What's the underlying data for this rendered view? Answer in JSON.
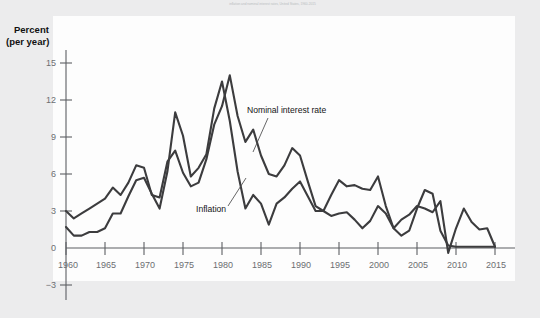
{
  "figure": {
    "header_note": "inflation and nominal interest rates, United States, 1960-2015",
    "axis_title_line1": "Percent",
    "axis_title_line2": "(per year)"
  },
  "annotations": {
    "nominal_label": "Nominal interest rate",
    "inflation_label": "Inflation"
  },
  "chart_data": {
    "type": "line",
    "title": "",
    "xlabel": "",
    "ylabel": "Percent (per year)",
    "xlim": [
      1960,
      2015
    ],
    "ylim": [
      -3,
      15
    ],
    "xticks": [
      1960,
      1965,
      1970,
      1975,
      1980,
      1985,
      1990,
      1995,
      2000,
      2005,
      2010,
      2015
    ],
    "yticks": [
      -3,
      0,
      3,
      6,
      9,
      12,
      15
    ],
    "ytick_labels": [
      "−3",
      "0",
      "3",
      "6",
      "9",
      "12",
      "15"
    ],
    "grid": false,
    "legend_position": "inline-annotation",
    "x": [
      1960,
      1961,
      1962,
      1963,
      1964,
      1965,
      1966,
      1967,
      1968,
      1969,
      1970,
      1971,
      1972,
      1973,
      1974,
      1975,
      1976,
      1977,
      1978,
      1979,
      1980,
      1981,
      1982,
      1983,
      1984,
      1985,
      1986,
      1987,
      1988,
      1989,
      1990,
      1991,
      1992,
      1993,
      1994,
      1995,
      1996,
      1997,
      1998,
      1999,
      2000,
      2001,
      2002,
      2003,
      2004,
      2005,
      2006,
      2007,
      2008,
      2009,
      2010,
      2011,
      2012,
      2013,
      2014,
      2015
    ],
    "series": [
      {
        "name": "Nominal interest rate",
        "values": [
          3.0,
          2.4,
          2.8,
          3.2,
          3.6,
          4.0,
          4.9,
          4.3,
          5.3,
          6.7,
          6.5,
          4.3,
          4.1,
          7.0,
          7.9,
          6.1,
          5.0,
          5.3,
          7.2,
          10.0,
          11.5,
          14.0,
          10.7,
          8.6,
          9.6,
          7.5,
          6.0,
          5.8,
          6.7,
          8.1,
          7.5,
          5.4,
          3.4,
          3.0,
          4.3,
          5.5,
          5.0,
          5.1,
          4.8,
          4.7,
          5.8,
          3.4,
          1.6,
          1.0,
          1.4,
          3.2,
          4.7,
          4.4,
          1.4,
          0.2,
          0.1,
          0.1,
          0.1,
          0.1,
          0.1,
          0.1
        ]
      },
      {
        "name": "Inflation",
        "values": [
          1.7,
          1.0,
          1.0,
          1.3,
          1.3,
          1.6,
          2.8,
          2.8,
          4.2,
          5.5,
          5.7,
          4.4,
          3.2,
          6.2,
          11.0,
          9.1,
          5.8,
          6.5,
          7.6,
          11.3,
          13.5,
          10.3,
          6.2,
          3.2,
          4.3,
          3.6,
          1.9,
          3.6,
          4.1,
          4.8,
          5.4,
          4.2,
          3.0,
          3.0,
          2.6,
          2.8,
          2.9,
          2.3,
          1.6,
          2.2,
          3.4,
          2.8,
          1.6,
          2.3,
          2.7,
          3.4,
          3.2,
          2.9,
          3.8,
          -0.4,
          1.6,
          3.2,
          2.1,
          1.5,
          1.6,
          0.1
        ]
      }
    ]
  }
}
